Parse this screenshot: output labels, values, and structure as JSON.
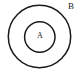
{
  "diagram": {
    "type": "venn-subset",
    "background_color": "#ffffff",
    "stroke_color": "#1a1a1a",
    "canvas": {
      "width": 82,
      "height": 74
    },
    "sets": [
      {
        "id": "outer",
        "label": "B",
        "role": "superset",
        "center_x": 39.5,
        "center_y": 36.5,
        "radius": 31.2,
        "stroke_width": 1.5,
        "fill": "none",
        "label_x": 71,
        "label_y": 6.5,
        "label_font_size": 9,
        "label_position": "outside-top-right"
      },
      {
        "id": "inner",
        "label": "A",
        "role": "subset",
        "center_x": 39.8,
        "center_y": 37,
        "radius": 15.2,
        "stroke_width": 1.5,
        "fill": "none",
        "label_x": 39.8,
        "label_y": 36.5,
        "label_font_size": 8,
        "label_position": "center"
      }
    ]
  }
}
